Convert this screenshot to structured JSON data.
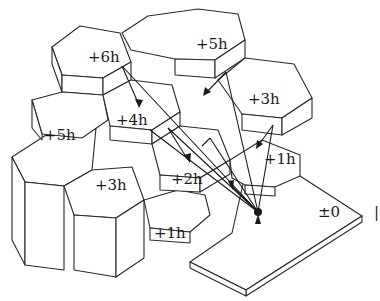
{
  "diagram": {
    "labels": [
      {
        "id": "h6",
        "text": "+6h",
        "x": 88,
        "y": 50
      },
      {
        "id": "h5a",
        "text": "+5h",
        "x": 196,
        "y": 37
      },
      {
        "id": "h5b",
        "text": "+5h",
        "x": 44,
        "y": 128
      },
      {
        "id": "h4",
        "text": "+4h",
        "x": 116,
        "y": 113
      },
      {
        "id": "h3a",
        "text": "+3h",
        "x": 248,
        "y": 92
      },
      {
        "id": "h3b",
        "text": "+3h",
        "x": 95,
        "y": 178
      },
      {
        "id": "h2",
        "text": "+2h",
        "x": 171,
        "y": 172
      },
      {
        "id": "h1a",
        "text": "+1h",
        "x": 264,
        "y": 152
      },
      {
        "id": "h1b",
        "text": "+1h",
        "x": 154,
        "y": 226
      },
      {
        "id": "base",
        "text": "±0",
        "x": 318,
        "y": 205
      }
    ],
    "edge_mark": "|"
  }
}
